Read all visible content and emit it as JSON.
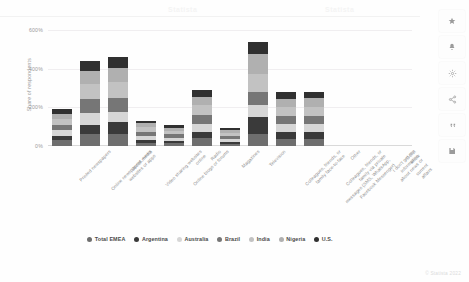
{
  "watermark": {
    "left": "Statista",
    "right": "Statista"
  },
  "footer": {
    "copyright": "© Statista 2022"
  },
  "rail": {
    "items": [
      {
        "name": "star-icon",
        "label": "Favorite"
      },
      {
        "name": "bell-icon",
        "label": "Notify"
      },
      {
        "name": "gear-icon",
        "label": "Settings"
      },
      {
        "name": "share-icon",
        "label": "Share"
      },
      {
        "name": "quote-icon",
        "label": "Cite"
      },
      {
        "name": "save-icon",
        "label": "Save"
      }
    ]
  },
  "chart_data": {
    "type": "bar",
    "stacked": true,
    "title": "",
    "xlabel": "",
    "ylabel": "Share of respondents",
    "ylim": [
      0,
      600
    ],
    "yticks": [
      "0%",
      "200%",
      "400%",
      "600%"
    ],
    "ytick_values": [
      0,
      200,
      400,
      600
    ],
    "grid": true,
    "legend_position": "bottom",
    "categories": [
      "Printed newspapers",
      "Online newspapers, news\nwebsites or apps",
      "Social media",
      "Video sharing websites\nonline",
      "Online blogs or forums",
      "Radio",
      "Magazines",
      "Television",
      "Colleagues, friends, or\nfamily face-to-face",
      "Colleagues, friends, or\nfamily via private\nmessages (SMS, WhatsApp,\nFacebook Messenger)",
      "Other",
      "I don't get my information\nabout news or current\naffairs",
      "Don't know"
    ],
    "series": [
      {
        "name": "Total EMEA",
        "color": "#6e6e6e",
        "values": [
          30,
          62,
          60,
          16,
          14,
          40,
          12,
          64,
          38,
          38,
          0,
          0,
          0
        ]
      },
      {
        "name": "Argentina",
        "color": "#3a3a3a",
        "values": [
          24,
          46,
          64,
          16,
          12,
          30,
          10,
          88,
          34,
          36,
          0,
          0,
          0
        ]
      },
      {
        "name": "Australia",
        "color": "#d6d6d6",
        "values": [
          28,
          64,
          52,
          20,
          16,
          42,
          14,
          58,
          40,
          40,
          0,
          0,
          0
        ]
      },
      {
        "name": "Brazil",
        "color": "#767676",
        "values": [
          26,
          72,
          74,
          22,
          18,
          46,
          16,
          70,
          44,
          42,
          0,
          0,
          0
        ]
      },
      {
        "name": "India",
        "color": "#c2c2c2",
        "values": [
          34,
          78,
          82,
          24,
          20,
          52,
          18,
          92,
          48,
          46,
          0,
          0,
          0
        ]
      },
      {
        "name": "Nigeria",
        "color": "#b0b0b0",
        "values": [
          22,
          66,
          70,
          20,
          16,
          44,
          14,
          106,
          42,
          44,
          0,
          0,
          0
        ]
      },
      {
        "name": "U.S.",
        "color": "#303030",
        "values": [
          26,
          52,
          58,
          14,
          12,
          36,
          12,
          62,
          34,
          34,
          0,
          0,
          0
        ]
      }
    ]
  }
}
